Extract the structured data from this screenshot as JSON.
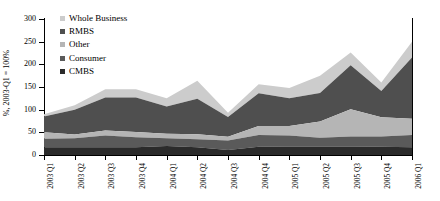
{
  "chart_data": {
    "type": "area",
    "title": "",
    "xlabel": "",
    "ylabel": "%, 2003-Q1 = 100%",
    "ylim": [
      0,
      300
    ],
    "ytick_step": 50,
    "yticks": [
      "0",
      "50",
      "100",
      "150",
      "200",
      "250",
      "300"
    ],
    "grid": false,
    "stacked": true,
    "legend_position": "top-left-inside",
    "categories": [
      "2003 Q1",
      "2003 Q2",
      "2003 Q3",
      "2003 Q4",
      "2004 Q1",
      "2004 Q2",
      "2004 Q3",
      "2004 Q4",
      "2005 Q1",
      "2005 Q2",
      "2005 Q3",
      "2005 Q4",
      "2006 Q1"
    ],
    "series": [
      {
        "name": "CMBS",
        "color": "#2b2b2b",
        "values": [
          17,
          17,
          17,
          17,
          20,
          17,
          11,
          18,
          19,
          19,
          19,
          18,
          17
        ]
      },
      {
        "name": "Consumer",
        "color": "#5a5a5a",
        "values": [
          19,
          20,
          26,
          22,
          17,
          18,
          21,
          26,
          24,
          19,
          22,
          23,
          27
        ]
      },
      {
        "name": "Other",
        "color": "#b5b5b5",
        "values": [
          14,
          8,
          11,
          12,
          10,
          11,
          8,
          20,
          21,
          36,
          60,
          42,
          36
        ]
      },
      {
        "name": "RMBS",
        "color": "#4f4f4f",
        "values": [
          35,
          55,
          73,
          76,
          60,
          78,
          44,
          72,
          61,
          63,
          97,
          58,
          135
        ]
      },
      {
        "name": "Whole Business",
        "color": "#cccccc",
        "values": [
          5,
          10,
          18,
          18,
          18,
          40,
          9,
          20,
          23,
          38,
          28,
          19,
          35
        ]
      }
    ],
    "totals": [
      90,
      110,
      145,
      145,
      125,
      164,
      93,
      156,
      148,
      175,
      226,
      160,
      250
    ]
  },
  "legend": {
    "items": [
      {
        "label": "Whole Business"
      },
      {
        "label": "RMBS"
      },
      {
        "label": "Other"
      },
      {
        "label": "Consumer"
      },
      {
        "label": "CMBS"
      }
    ]
  }
}
